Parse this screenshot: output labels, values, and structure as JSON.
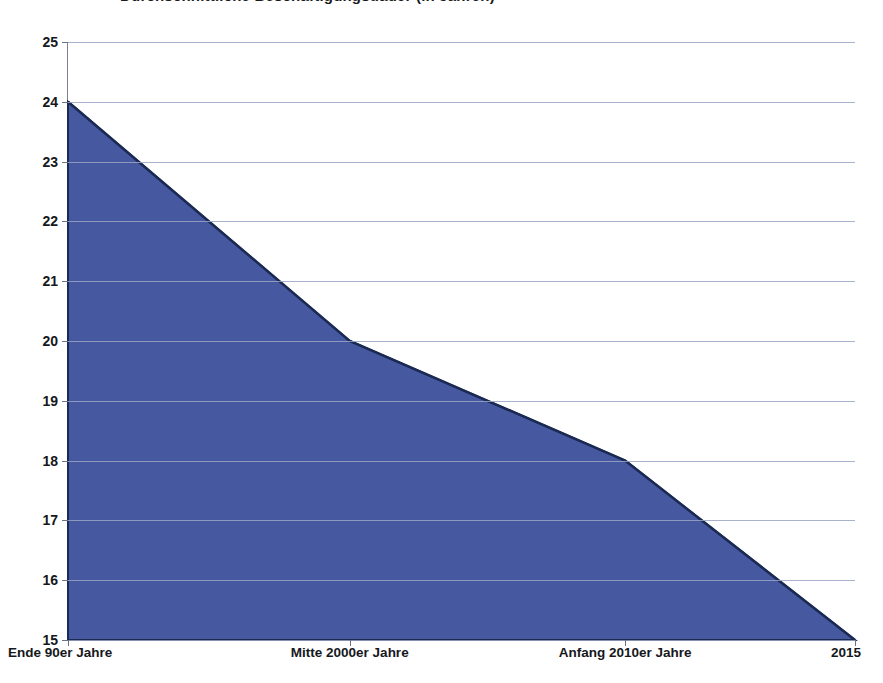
{
  "title": {
    "text": "Durchschnittliche Beschäftigungsdauer (in Jahren)",
    "clipped": true
  },
  "chart_data": {
    "type": "area",
    "title": "Durchschnittliche Beschäftigungsdauer (in Jahren)",
    "xlabel": "",
    "ylabel": "",
    "categories": [
      "Ende 90er Jahre",
      "Mitte 2000er Jahre",
      "Anfang 2010er Jahre",
      "2015"
    ],
    "values": [
      24,
      20,
      18,
      15
    ],
    "series": [
      {
        "name": "Beschäftigungsdauer",
        "values": [
          24,
          20,
          18,
          15
        ],
        "fill_color": "#4558A0",
        "line_color": "#1b2a52"
      }
    ],
    "ylim": [
      15,
      25
    ],
    "ytick_labels": [
      "25",
      "24",
      "23",
      "22",
      "21",
      "20",
      "19",
      "18",
      "17",
      "16",
      "15"
    ],
    "ytick_values": [
      25,
      24,
      23,
      22,
      21,
      20,
      19,
      18,
      17,
      16,
      15
    ],
    "xtick_labels": [
      "Ende 90er Jahre",
      "Mitte 2000er Jahre",
      "Anfang 2010er Jahre",
      "2015"
    ],
    "grid": true,
    "grid_axis": "y",
    "grid_color": "#9aa4c4",
    "legend": false,
    "legend_position": "none",
    "background_color": "#ffffff"
  },
  "axes": {
    "y_ticks": [
      {
        "label": "25",
        "value": 25
      },
      {
        "label": "24",
        "value": 24
      },
      {
        "label": "23",
        "value": 23
      },
      {
        "label": "22",
        "value": 22
      },
      {
        "label": "21",
        "value": 21
      },
      {
        "label": "20",
        "value": 20
      },
      {
        "label": "19",
        "value": 19
      },
      {
        "label": "18",
        "value": 18
      },
      {
        "label": "17",
        "value": 17
      },
      {
        "label": "16",
        "value": 16
      },
      {
        "label": "15",
        "value": 15
      }
    ],
    "x_ticks": [
      {
        "label": "Ende 90er Jahre",
        "value": 24
      },
      {
        "label": "Mitte 2000er Jahre",
        "value": 20
      },
      {
        "label": "Anfang 2010er Jahre",
        "value": 18
      },
      {
        "label": "2015",
        "value": 15
      }
    ]
  },
  "colors": {
    "series_fill": "#4558A0",
    "series_stroke": "#1b2a52",
    "gridline": "#9aa4c4",
    "axis": "#7d8093",
    "text": "#16181c",
    "background": "#ffffff"
  }
}
